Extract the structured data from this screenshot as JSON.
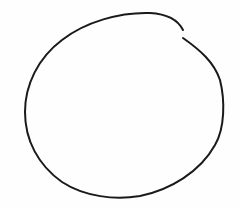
{
  "drawing": {
    "subject": "hand-drawn circle with small gap at upper right",
    "stroke_color": "#1a1a1a",
    "background_color": "#fefefe",
    "stroke_width": 2
  }
}
